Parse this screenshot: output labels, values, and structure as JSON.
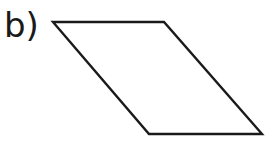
{
  "figure": {
    "label": "b)",
    "shape": "parallelogram",
    "stroke_color": "#1a1a1a",
    "fill_color": "#ffffff",
    "vertices": [
      [
        53,
        22
      ],
      [
        164,
        22
      ],
      [
        262,
        134
      ],
      [
        149,
        134
      ]
    ]
  }
}
